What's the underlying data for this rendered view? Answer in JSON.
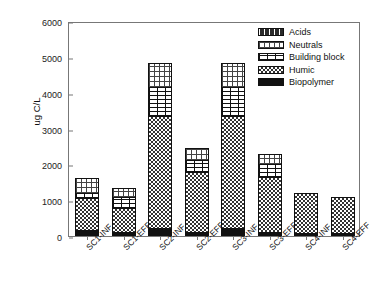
{
  "chart_data": {
    "type": "bar",
    "subtype": "stacked-bar",
    "title": "",
    "xlabel": "",
    "ylabel": "ug C/L",
    "ylim": [
      0,
      6000
    ],
    "yticks": [
      0,
      1000,
      2000,
      3000,
      4000,
      5000,
      6000
    ],
    "grid": false,
    "legend_position": "top-right",
    "legend_order_top_to_bottom": [
      "Acids",
      "Neutrals",
      "Building block",
      "Humic",
      "Biopolymer"
    ],
    "categories": [
      "SC1-INF",
      "SC1-EFF",
      "SC2-INF",
      "SC2-EFF",
      "SC3-INF",
      "SC3-EFF",
      "SC4-INF",
      "SC4-EFF"
    ],
    "stack_order_bottom_to_top": [
      "Biopolymer",
      "Humic",
      "Building block",
      "Neutrals",
      "Acids"
    ],
    "series": [
      {
        "name": "Biopolymer",
        "values": [
          130,
          60,
          175,
          60,
          175,
          60,
          35,
          40
        ]
      },
      {
        "name": "Humic",
        "values": [
          900,
          700,
          3160,
          1710,
          3150,
          1580,
          1165,
          1050
        ]
      },
      {
        "name": "Building block",
        "values": [
          150,
          320,
          830,
          340,
          830,
          350,
          0,
          0
        ]
      },
      {
        "name": "Neutrals",
        "values": [
          440,
          260,
          665,
          340,
          675,
          290,
          0,
          0
        ]
      },
      {
        "name": "Acids",
        "values": [
          0,
          0,
          0,
          0,
          0,
          0,
          0,
          0
        ]
      }
    ],
    "totals": [
      1620,
      1340,
      4830,
      2450,
      4830,
      2280,
      1200,
      1090
    ]
  },
  "legend": {
    "items": [
      {
        "label": "Acids",
        "pattern": "dashes-on-dark"
      },
      {
        "label": "Neutrals",
        "pattern": "fine-grid"
      },
      {
        "label": "Building block",
        "pattern": "brick-horizontal-lines"
      },
      {
        "label": "Humic",
        "pattern": "checkerboard"
      },
      {
        "label": "Biopolymer",
        "pattern": "solid-black"
      }
    ]
  },
  "colors": {
    "axis": "#777777",
    "text": "#111111",
    "bar_outline": "#111111",
    "background": "#ffffff"
  }
}
